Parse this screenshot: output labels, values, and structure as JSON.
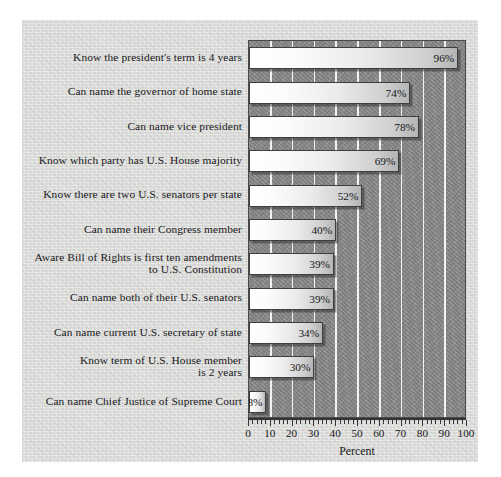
{
  "chart_data": {
    "type": "bar",
    "orientation": "horizontal",
    "title": "",
    "xlabel": "Percent",
    "ylabel": "",
    "xlim": [
      0,
      100
    ],
    "xticks": [
      0,
      10,
      20,
      30,
      40,
      50,
      60,
      70,
      80,
      90,
      100
    ],
    "xtick_labels": [
      "0",
      "10",
      "20",
      "30",
      "40",
      "50",
      "60",
      "70",
      "80",
      "90",
      "100"
    ],
    "minor_tick_interval": 2,
    "grid": "vertical white gridlines every 10 percent",
    "legend": "none",
    "value_label_suffix": "%",
    "categories": [
      "Know the president's term is 4 years",
      "Can name the governor of home state",
      "Can name vice president",
      "Know which party has U.S. House majority",
      "Know there are two U.S. senators per state",
      "Can name their Congress member",
      "Aware Bill of Rights is first ten amendments\nto U.S. Constitution",
      "Can name both of their U.S. senators",
      "Can name current U.S. secretary of state",
      "Know term of U.S. House member\nis 2 years",
      "Can name Chief Justice of Supreme Court"
    ],
    "values": [
      96,
      74,
      78,
      69,
      52,
      40,
      39,
      39,
      34,
      30,
      8
    ],
    "value_labels": [
      "96%",
      "74%",
      "78%",
      "69%",
      "52%",
      "40%",
      "39%",
      "39%",
      "34%",
      "30%",
      "8%"
    ]
  },
  "colors": {
    "page_background": "#ffffff",
    "panel_background": "#d8d8d6",
    "plot_background": "#8c8c8c",
    "gridline": "#f2f2f2",
    "bar_fill_light": "#ffffff",
    "bar_fill_dark": "#b4b4b4",
    "bar_border": "#3f3f3f",
    "text": "#17171a",
    "axis": "#33333a"
  }
}
